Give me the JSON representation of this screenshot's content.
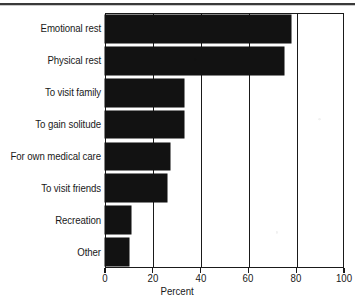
{
  "chart_data": {
    "type": "bar",
    "orientation": "horizontal",
    "title": "",
    "xlabel": "Percent",
    "ylabel": "",
    "categories": [
      "Emotional rest",
      "Physical rest",
      "To visit family",
      "To gain solitude",
      "For own medical care",
      "To visit friends",
      "Recreation",
      "Other"
    ],
    "values": [
      78,
      75,
      33,
      33,
      27,
      26,
      11,
      10
    ],
    "xlim": [
      0,
      100
    ],
    "xticks": [
      0,
      20,
      40,
      60,
      80,
      100
    ],
    "xticklabels": [
      "0",
      "20",
      "40",
      "60",
      "80",
      "100"
    ],
    "grid": true,
    "grid_axis": "x",
    "legend": false,
    "bar_color": "#121212",
    "axis_color": "#1a1a1a",
    "background_color": "#ffffff"
  },
  "figure": {
    "top_rule": "horizontal-rule",
    "axis_title": "Percent"
  }
}
